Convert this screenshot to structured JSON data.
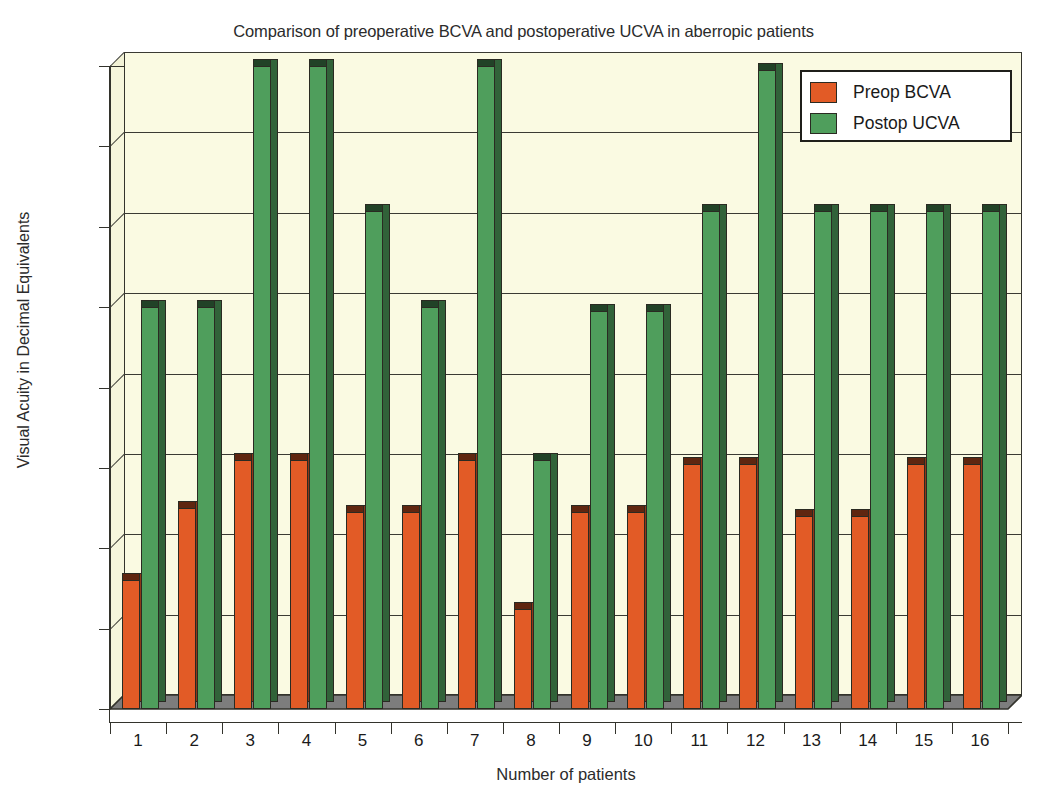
{
  "chart_data": {
    "type": "bar",
    "title": "Comparison of preoperative BCVA and postoperative UCVA in aberropic patients",
    "xlabel": "Number of patients",
    "ylabel": "Visual Acuity in Decimal Equivalents",
    "categories": [
      "1",
      "2",
      "3",
      "4",
      "5",
      "6",
      "7",
      "8",
      "9",
      "10",
      "11",
      "12",
      "13",
      "14",
      "15",
      "16"
    ],
    "series": [
      {
        "name": "Preop BCVA",
        "color": "#E25B26",
        "values": [
          0.32,
          0.5,
          0.62,
          0.62,
          0.49,
          0.49,
          0.62,
          0.25,
          0.49,
          0.49,
          0.61,
          0.61,
          0.48,
          0.48,
          0.61,
          0.61
        ]
      },
      {
        "name": "Postop UCVA",
        "color": "#4F9E5C",
        "values": [
          1.0,
          1.0,
          1.6,
          1.6,
          1.24,
          1.0,
          1.6,
          0.62,
          0.99,
          0.99,
          1.24,
          1.59,
          1.24,
          1.24,
          1.24,
          1.24
        ]
      }
    ],
    "ylim": [
      0,
      1.6
    ],
    "yticks": [
      "0",
      "0.2",
      "0.4",
      "0.6",
      "0.8",
      "1",
      "1.2",
      "1.4",
      "1.6"
    ],
    "ytick_values": [
      0,
      0.2,
      0.4,
      0.6,
      0.8,
      1.0,
      1.2,
      1.4,
      1.6
    ],
    "grid": true,
    "legend_position": "top-right",
    "plot_background": "#FAFAE2",
    "floor_color": "#7D7D7D",
    "axis_color": "#33332C"
  },
  "legend": {
    "items": [
      {
        "label": "Preop BCVA",
        "color": "#E25B26"
      },
      {
        "label": "Postop UCVA",
        "color": "#4F9E5C"
      }
    ]
  }
}
